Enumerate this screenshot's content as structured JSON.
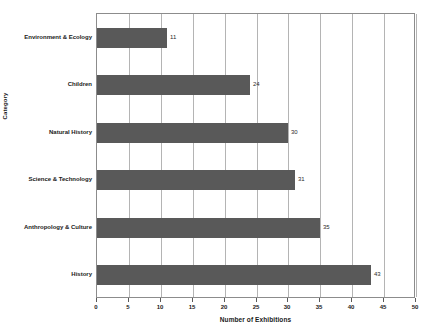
{
  "chart_data": {
    "type": "bar",
    "orientation": "horizontal",
    "title": "",
    "xlabel": "Number of Exhibitions",
    "ylabel": "Category",
    "categories": [
      "Environment & Ecology",
      "Children",
      "Natural History",
      "Science & Technology",
      "Anthropology & Culture",
      "History"
    ],
    "values": [
      11,
      24,
      30,
      31,
      35,
      43
    ],
    "value_labels": [
      "11",
      "24",
      "30",
      "31",
      "35",
      "43"
    ],
    "xlim": [
      0,
      50
    ],
    "xticks": [
      0,
      5,
      10,
      15,
      20,
      25,
      30,
      35,
      40,
      45,
      50
    ],
    "xtick_labels": [
      "0",
      "5",
      "10",
      "15",
      "20",
      "25",
      "30",
      "35",
      "40",
      "45",
      "50"
    ],
    "grid": "vertical",
    "legend": "none",
    "bar_color": "#595959",
    "grid_color": "#b4b4b4",
    "axis_color": "#8c8c8c",
    "background_color": "#ffffff",
    "text_color": "#1a1a1a"
  }
}
